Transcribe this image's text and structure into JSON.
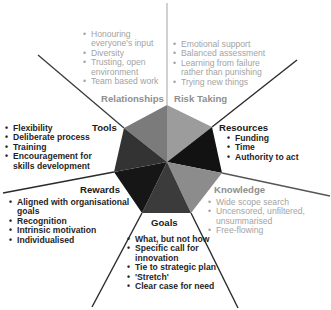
{
  "diagram": {
    "center_shape": "heptagon",
    "segments": [
      {
        "key": "relationships",
        "title": "Relationships",
        "tone": "light",
        "fill": "#7b7b7b",
        "items": [
          "Honouring everyone's input",
          "Diversity",
          "Trusting, open environment",
          "Team based work"
        ]
      },
      {
        "key": "risk_taking",
        "title": "Risk Taking",
        "tone": "light",
        "fill": "#9c9c9c",
        "items": [
          "Emotional support",
          "Balanced assessment",
          "Learning from failure rather than punishing",
          "Trying new things"
        ]
      },
      {
        "key": "resources",
        "title": "Resources",
        "tone": "dark",
        "fill": "#121212",
        "items": [
          "Funding",
          "Time",
          "Authority to act"
        ]
      },
      {
        "key": "knowledge",
        "title": "Knowledge",
        "tone": "light",
        "fill": "#8c8c8c",
        "items": [
          "Wide scope search",
          "Uncensored, unfiltered, unsummarised",
          "Free-flowing"
        ]
      },
      {
        "key": "goals",
        "title": "Goals",
        "tone": "dark",
        "fill": "#3b3b3b",
        "items": [
          "What, but not how",
          "Specific call for innovation",
          "Tie to strategic plan",
          "'Stretch'",
          "Clear case for need"
        ]
      },
      {
        "key": "rewards",
        "title": "Rewards",
        "tone": "dark",
        "fill": "#161616",
        "items": [
          "Aligned with organisational goals",
          "Recognition",
          "Intrinsic motivation",
          "Individualised"
        ]
      },
      {
        "key": "tools",
        "title": "Tools",
        "tone": "dark",
        "fill": "#333333",
        "items": [
          "Flexibility",
          "Deliberate process",
          "Training",
          "Encouragement for skills development"
        ]
      }
    ],
    "colors": {
      "spoke_dark": "#2a2a2a",
      "spoke_light": "#bdbdbd",
      "text_light": "#a3a3a3",
      "text_dark": "#1f1f1f"
    }
  }
}
